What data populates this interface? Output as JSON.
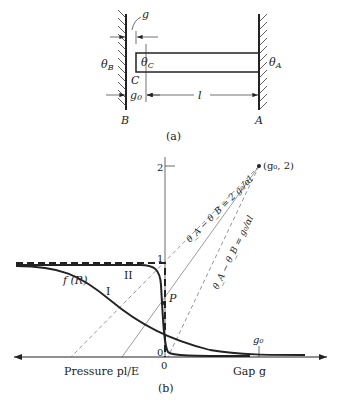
{
  "part_a": {
    "caption": "(a)",
    "labels": {
      "g": "g",
      "theta_B": "θ",
      "theta_B_sub": "B",
      "theta_C": "θ",
      "theta_C_sub": "C",
      "theta_A": "θ",
      "theta_A_sub": "A",
      "C": "C",
      "g0": "g",
      "g0_sub": "0",
      "l": "l",
      "B": "B",
      "A": "A"
    }
  },
  "part_b": {
    "caption": "(b)",
    "y_ticks": [
      "2",
      "1",
      "0"
    ],
    "x_origin": "0",
    "point_label": "(g₀, 2)",
    "line_label_1": "θ_A − θ_B = 2 g₀/αl",
    "line_label_2": "θ_A − θ_B = g₀/αl",
    "curve_fR": "f (R)",
    "curve_I": "I",
    "curve_II": "II",
    "point_P": "P",
    "g0_tick": "g₀",
    "left_axis_label": "Pressure pl/E",
    "right_axis_label": "Gap g"
  },
  "colors": {
    "ink": "#222222",
    "dashed": "#555555",
    "background": "#ffffff"
  }
}
